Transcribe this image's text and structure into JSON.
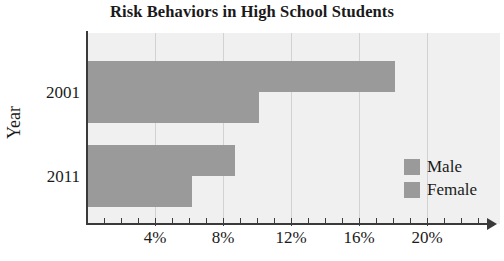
{
  "chart_data": {
    "type": "bar",
    "orientation": "horizontal",
    "title": "Risk Behaviors in High School Students",
    "xlabel": "",
    "ylabel": "Year",
    "categories": [
      "2001",
      "2011"
    ],
    "series": [
      {
        "name": "Male",
        "values": [
          18.1,
          8.7
        ],
        "color": "#9a9a9a"
      },
      {
        "name": "Female",
        "values": [
          10.1,
          6.2
        ],
        "color": "#9a9a9a"
      }
    ],
    "xlim": [
      0,
      24.3
    ],
    "xticks": [
      4,
      8,
      12,
      16,
      20
    ],
    "xtick_labels": [
      "4%",
      "8%",
      "12%",
      "16%",
      "20%"
    ],
    "xtick_minor": [
      1,
      2,
      3,
      5,
      6,
      7,
      9,
      10,
      11,
      13,
      14,
      15,
      17,
      18,
      19,
      21,
      22,
      23
    ],
    "grid": true,
    "grid_axis": "x",
    "grid_color": "#d2d2d2",
    "plot_background": "#f0f0f0",
    "axis_color": "#3a3a3a",
    "x_axis_arrow": true,
    "legend_position": "center right",
    "legend_entries": [
      "Male",
      "Female"
    ]
  },
  "legend": {
    "items": [
      {
        "label": "Male"
      },
      {
        "label": "Female"
      }
    ]
  },
  "axis": {
    "y_title": "Year"
  }
}
